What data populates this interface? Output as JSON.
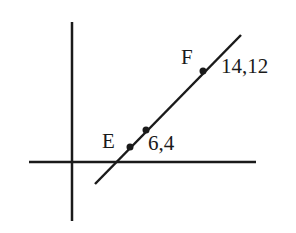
{
  "diagram": {
    "type": "coordinate-line",
    "background": "#ffffff",
    "stroke_color": "#1a1a1a",
    "axes": {
      "x_axis": {
        "x1": 29,
        "y1": 162,
        "x2": 256,
        "y2": 162
      },
      "y_axis": {
        "x1": 72,
        "y1": 22,
        "x2": 72,
        "y2": 221
      }
    },
    "line": {
      "x1": 95,
      "y1": 184,
      "x2": 241,
      "y2": 35
    },
    "points": [
      {
        "id": "E",
        "label": "E",
        "px": 130,
        "py": 147,
        "label_x": 102,
        "label_y": 148
      },
      {
        "id": "mid",
        "label": "",
        "px": 146,
        "py": 130,
        "coord_label": "6,4",
        "coord_x": 148,
        "coord_y": 150
      },
      {
        "id": "F",
        "label": "F",
        "px": 203,
        "py": 71,
        "label_x": 181,
        "label_y": 64,
        "coord_label": "14,12",
        "coord_x": 221,
        "coord_y": 73
      }
    ],
    "labels": {
      "E": "E",
      "F": "F",
      "coord_low": "6,4",
      "coord_high": "14,12"
    }
  }
}
